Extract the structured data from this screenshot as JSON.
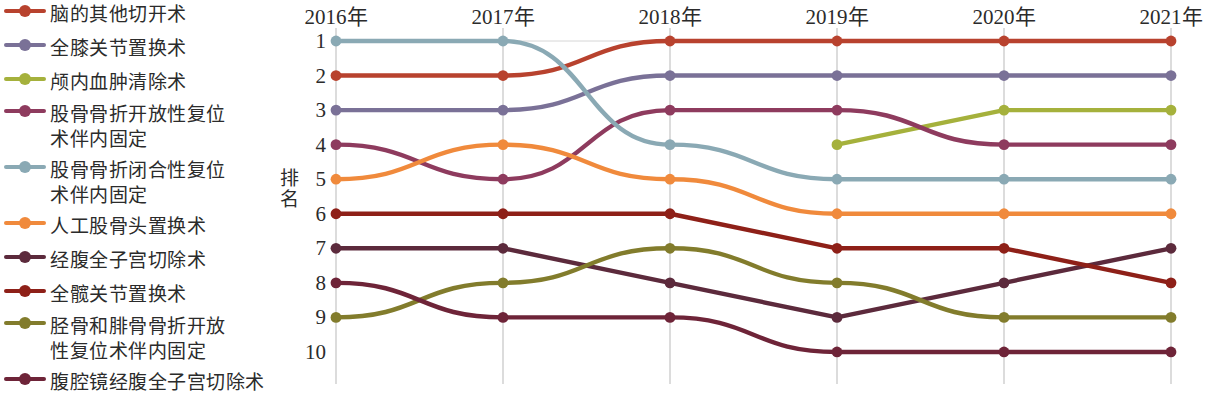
{
  "legend": {
    "items": [
      {
        "label": "脑的其他切开术",
        "color": "#b8422e",
        "key": "brain_other_incision"
      },
      {
        "label": "全膝关节置换术",
        "color": "#7a7197",
        "key": "total_knee_replacement"
      },
      {
        "label": "颅内血肿清除术",
        "color": "#a5b13c",
        "key": "intracranial_hematoma_removal"
      },
      {
        "label": "股骨骨折开放性复位\n术伴内固定",
        "color": "#8e3b5e",
        "key": "femur_open_reduction"
      },
      {
        "label": "股骨骨折闭合性复位\n术伴内固定",
        "color": "#8aa9b4",
        "key": "femur_closed_reduction"
      },
      {
        "label": "人工股骨头置换术",
        "color": "#f08a3c",
        "key": "femoral_head_replacement"
      },
      {
        "label": "经腹全子宫切除术",
        "color": "#5c2a3c",
        "key": "abdominal_hysterectomy"
      },
      {
        "label": "全髋关节置换术",
        "color": "#8e2018",
        "key": "total_hip_replacement"
      },
      {
        "label": "胫骨和腓骨骨折开放\n性复位术伴内固定",
        "color": "#827c2c",
        "key": "tibia_fibula_open_reduction"
      },
      {
        "label": "腹腔镜经腹全子宫切除术",
        "color": "#6e2438",
        "key": "laparoscopic_hysterectomy"
      }
    ]
  },
  "axes": {
    "ylabel": "排名",
    "yticks": [
      "1",
      "2",
      "3",
      "4",
      "5",
      "6",
      "7",
      "8",
      "9",
      "10"
    ],
    "xticks": [
      "2016年",
      "2017年",
      "2018年",
      "2019年",
      "2020年",
      "2021年"
    ]
  },
  "chart_data": {
    "type": "line",
    "title": "",
    "xlabel": "",
    "ylabel": "排名",
    "categories": [
      "2016年",
      "2017年",
      "2018年",
      "2019年",
      "2020年",
      "2021年"
    ],
    "ylim": [
      1,
      10
    ],
    "y_inverted": true,
    "grid": "vertical",
    "legend_position": "left",
    "series": [
      {
        "name": "脑的其他切开术",
        "color": "#b8422e",
        "values": [
          2,
          2,
          1,
          1,
          1,
          1
        ]
      },
      {
        "name": "全膝关节置换术",
        "color": "#7a7197",
        "values": [
          3,
          3,
          2,
          2,
          2,
          2
        ]
      },
      {
        "name": "颅内血肿清除术",
        "color": "#a5b13c",
        "values": [
          null,
          null,
          null,
          4,
          3,
          3
        ]
      },
      {
        "name": "股骨骨折开放性复位术伴内固定",
        "color": "#8e3b5e",
        "values": [
          4,
          5,
          3,
          3,
          4,
          4
        ]
      },
      {
        "name": "股骨骨折闭合性复位术伴内固定",
        "color": "#8aa9b4",
        "values": [
          1,
          1,
          4,
          5,
          5,
          5
        ]
      },
      {
        "name": "人工股骨头置换术",
        "color": "#f08a3c",
        "values": [
          5,
          4,
          5,
          6,
          6,
          6
        ]
      },
      {
        "name": "经腹全子宫切除术",
        "color": "#5c2a3c",
        "values": [
          7,
          7,
          8,
          9,
          8,
          7
        ]
      },
      {
        "name": "全髋关节置换术",
        "color": "#8e2018",
        "values": [
          6,
          6,
          6,
          7,
          7,
          8
        ]
      },
      {
        "name": "胫骨和腓骨骨折开放性复位术伴内固定",
        "color": "#827c2c",
        "values": [
          9,
          8,
          7,
          8,
          9,
          9
        ]
      },
      {
        "name": "腹腔镜经腹全子宫切除术",
        "color": "#6e2438",
        "values": [
          8,
          9,
          9,
          10,
          10,
          10
        ]
      }
    ]
  }
}
